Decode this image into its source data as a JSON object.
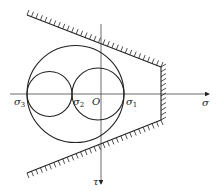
{
  "diagram": {
    "type": "Mohr circles with failure envelope",
    "axes": {
      "horizontal_label": "σ",
      "vertical_label": "τ",
      "origin_label": "O"
    },
    "points": [
      {
        "symbol": "σ",
        "subscript": "3"
      },
      {
        "symbol": "σ",
        "subscript": "2"
      },
      {
        "symbol": "σ",
        "subscript": "1"
      }
    ],
    "circles": [
      {
        "name": "large circle",
        "from": "σ3",
        "to": "σ1"
      },
      {
        "name": "left small circle",
        "from": "σ3",
        "to": "σ2"
      },
      {
        "name": "right small circle",
        "from": "σ2",
        "to": "σ1"
      }
    ],
    "envelope": [
      "upper limit line (hatched)",
      "lower limit line (hatched)",
      "vertical cut-off (hatched)"
    ],
    "colors": {
      "stroke": "#222222",
      "background": "#ffffff"
    }
  }
}
